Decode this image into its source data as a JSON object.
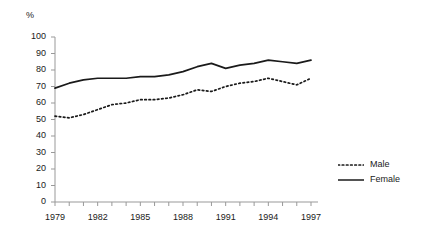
{
  "chart_data": {
    "type": "line",
    "title": "",
    "xlabel": "",
    "ylabel": "%",
    "ylim": [
      0,
      100
    ],
    "xlim": [
      1979,
      1997
    ],
    "grid": false,
    "legend_position": "right",
    "x": [
      1979,
      1980,
      1981,
      1982,
      1983,
      1984,
      1985,
      1986,
      1987,
      1988,
      1989,
      1990,
      1991,
      1992,
      1993,
      1994,
      1995,
      1996,
      1997
    ],
    "y_ticks": [
      0,
      10,
      20,
      30,
      40,
      50,
      60,
      70,
      80,
      90,
      100
    ],
    "x_ticks": [
      1979,
      1982,
      1985,
      1988,
      1991,
      1994,
      1997
    ],
    "x_tick_labels": [
      "1979",
      "1982",
      "1985",
      "1988",
      "1991",
      "1994",
      "1997"
    ],
    "y_tick_labels": [
      "0",
      "10",
      "20",
      "30",
      "40",
      "50",
      "60",
      "70",
      "80",
      "90",
      "100"
    ],
    "series": [
      {
        "name": "Male",
        "style": "dotted",
        "color": "#1a1a1a",
        "values": [
          52,
          51,
          53,
          56,
          59,
          60,
          62,
          62,
          63,
          65,
          68,
          67,
          70,
          72,
          73,
          75,
          73,
          71,
          75
        ]
      },
      {
        "name": "Female",
        "style": "solid",
        "color": "#1a1a1a",
        "values": [
          69,
          72,
          74,
          75,
          75,
          75,
          76,
          76,
          77,
          79,
          82,
          84,
          81,
          83,
          84,
          86,
          85,
          84,
          86
        ]
      }
    ],
    "legend": [
      {
        "label": "Male",
        "style": "dotted"
      },
      {
        "label": "Female",
        "style": "solid"
      }
    ]
  }
}
